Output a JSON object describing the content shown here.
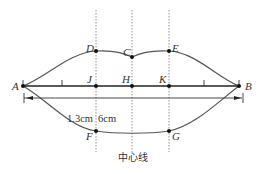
{
  "diagram": {
    "colors": {
      "line": "#333333",
      "dotted": "#888888",
      "point": "#111111",
      "background": "#ffffff"
    },
    "points": {
      "A": {
        "label": "A",
        "x": 23,
        "y": 86
      },
      "B": {
        "label": "B",
        "x": 239,
        "y": 86
      },
      "C": {
        "label": "C",
        "x": 132,
        "y": 57
      },
      "D": {
        "label": "D",
        "x": 96,
        "y": 51
      },
      "E": {
        "label": "E",
        "x": 169,
        "y": 51
      },
      "F": {
        "label": "F",
        "x": 96,
        "y": 131
      },
      "G": {
        "label": "G",
        "x": 169,
        "y": 131
      },
      "H": {
        "label": "H",
        "x": 132,
        "y": 86
      },
      "J": {
        "label": "J",
        "x": 96,
        "y": 86
      },
      "K": {
        "label": "K",
        "x": 169,
        "y": 86
      }
    },
    "labels": {
      "A": "A",
      "B": "B",
      "C": "C",
      "D": "D",
      "E": "E",
      "F": "F",
      "G": "G",
      "H": "H",
      "J": "J",
      "K": "K",
      "dim_1": "1.3cm",
      "dim_2": "6cm",
      "center_line": "中心线"
    }
  }
}
